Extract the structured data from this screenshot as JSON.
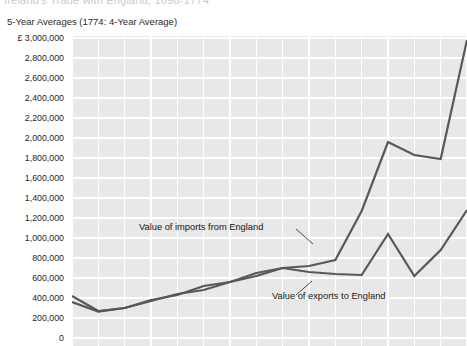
{
  "figure": {
    "cutoff_title_fragment": "Ireland's Trade with England, 1698-1774",
    "subtitle": "5-Year Averages (1774: 4-Year Average)"
  },
  "annotations": {
    "imports_label": "Value of imports from England",
    "exports_label": "Value of exports to England"
  },
  "style": {
    "plot_background": "#e8e8e8",
    "gridline_color": "#ffffff",
    "line_color": "#585858",
    "text_color": "#1a1a1a"
  },
  "chart_data": {
    "type": "line",
    "title": "Ireland's Trade with England, 1698-1774",
    "subtitle": "5-Year Averages (1774: 4-Year Average)",
    "xlabel": "",
    "ylabel": "",
    "ylim": [
      0,
      3000000
    ],
    "ytick_labels": [
      "£ 3,000,000",
      "2,800,000",
      "2,600,000",
      "2,400,000",
      "2,200,000",
      "2,000,000",
      "1,800,000",
      "1,600,000",
      "1,400,000",
      "1,200,000",
      "1,000,000",
      "800,000",
      "600,000",
      "400,000",
      "200,000",
      "0"
    ],
    "ytick_values": [
      3000000,
      2800000,
      2600000,
      2400000,
      2200000,
      2000000,
      1800000,
      1600000,
      1400000,
      1200000,
      1000000,
      800000,
      600000,
      400000,
      200000,
      0
    ],
    "grid": true,
    "legend": "annotations",
    "x_count": 16,
    "series": [
      {
        "name": "Value of imports from England",
        "values": [
          420000,
          270000,
          300000,
          370000,
          440000,
          480000,
          560000,
          620000,
          700000,
          720000,
          780000,
          1270000,
          1960000,
          1830000,
          1790000,
          2980000
        ]
      },
      {
        "name": "Value of exports to England",
        "values": [
          360000,
          265000,
          300000,
          380000,
          430000,
          520000,
          560000,
          650000,
          700000,
          660000,
          640000,
          630000,
          1040000,
          620000,
          880000,
          1280000
        ]
      }
    ]
  }
}
